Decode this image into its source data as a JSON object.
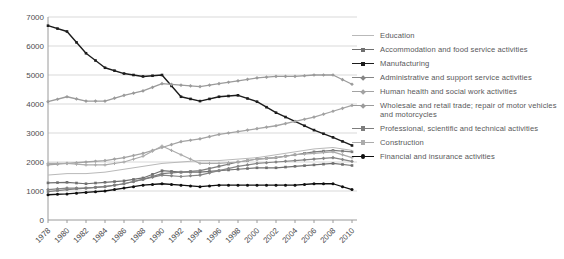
{
  "chart_data": {
    "type": "line",
    "title": "",
    "xlabel": "",
    "ylabel": "",
    "x": [
      1978,
      1980,
      1982,
      1984,
      1986,
      1988,
      1990,
      1992,
      1994,
      1996,
      1998,
      2000,
      2002,
      2004,
      2006,
      2008,
      2010
    ],
    "x_tick_labels": [
      "1978",
      "1980",
      "1982",
      "1984",
      "1986",
      "1988",
      "1990",
      "1992",
      "1994",
      "1996",
      "1998",
      "2000",
      "2002",
      "2004",
      "2006",
      "2008",
      "2010"
    ],
    "y_ticks": [
      0,
      1000,
      2000,
      3000,
      4000,
      5000,
      6000,
      7000
    ],
    "ylim": [
      0,
      7000
    ],
    "grid": "horizontal",
    "legend_position": "right",
    "series": [
      {
        "name": "Education",
        "color": "#b9b9b9",
        "marker": "none",
        "width": 1,
        "values": [
          1550,
          1600,
          1600,
          1650,
          1750,
          1850,
          1950,
          2000,
          2050,
          2050,
          2100,
          2150,
          2250,
          2350,
          2450,
          2500,
          2400
        ]
      },
      {
        "name": "Accommodation and food service activities",
        "color": "#6f6f6f",
        "marker": "square",
        "width": 1.2,
        "values": [
          1280,
          1300,
          1250,
          1300,
          1350,
          1450,
          1700,
          1650,
          1650,
          1700,
          1750,
          1800,
          1800,
          1850,
          1900,
          1950,
          1880
        ]
      },
      {
        "name": "Manufacturing",
        "color": "#1c1c1c",
        "marker": "square",
        "width": 1.4,
        "values": [
          6700,
          6500,
          5750,
          5250,
          5050,
          4950,
          5000,
          4250,
          4100,
          4250,
          4300,
          4080,
          3700,
          3400,
          3100,
          2850,
          2570
        ]
      },
      {
        "name": "Administrative and support service activities",
        "color": "#858585",
        "marker": "diamond",
        "width": 1.2,
        "values": [
          1050,
          1100,
          1100,
          1150,
          1250,
          1400,
          1550,
          1500,
          1550,
          1700,
          1850,
          1950,
          2000,
          2050,
          2100,
          2150,
          2020
        ]
      },
      {
        "name": "Human health and social work activities",
        "color": "#a3a3a3",
        "marker": "diamond",
        "width": 1.3,
        "values": [
          1900,
          1950,
          2000,
          2050,
          2150,
          2300,
          2500,
          2700,
          2800,
          2950,
          3050,
          3150,
          3250,
          3400,
          3550,
          3750,
          3950
        ]
      },
      {
        "name": "Wholesale and retail trade; repair of motor vehicles and motorcycles",
        "color": "#9b9b9b",
        "marker": "diamond",
        "width": 1.3,
        "values": [
          4080,
          4250,
          4100,
          4100,
          4300,
          4450,
          4700,
          4650,
          4600,
          4700,
          4800,
          4900,
          4950,
          4950,
          5000,
          5000,
          4680
        ]
      },
      {
        "name": "Professional, scientific and technical activities",
        "color": "#7d7d7d",
        "marker": "square",
        "width": 1.2,
        "values": [
          980,
          1050,
          1100,
          1150,
          1250,
          1400,
          1600,
          1650,
          1700,
          1850,
          2000,
          2100,
          2150,
          2250,
          2350,
          2400,
          2350
        ]
      },
      {
        "name": "Construction",
        "color": "#ababab",
        "marker": "plus",
        "width": 1.2,
        "values": [
          1950,
          1950,
          1900,
          1900,
          2000,
          2200,
          2550,
          2250,
          1950,
          1950,
          2000,
          2100,
          2150,
          2250,
          2300,
          2350,
          2150
        ]
      },
      {
        "name": "Financial and insurance activities",
        "color": "#0f0f0f",
        "marker": "circle",
        "width": 1.3,
        "values": [
          870,
          900,
          950,
          1000,
          1100,
          1200,
          1250,
          1200,
          1150,
          1200,
          1200,
          1200,
          1200,
          1200,
          1250,
          1250,
          1050
        ]
      }
    ],
    "style": {
      "text_color": "#4d4d4f",
      "legend_text_color": "#58585a",
      "grid_color": "#c9c9c9",
      "axis_color": "#9a9a9a",
      "background": "#ffffff"
    }
  }
}
